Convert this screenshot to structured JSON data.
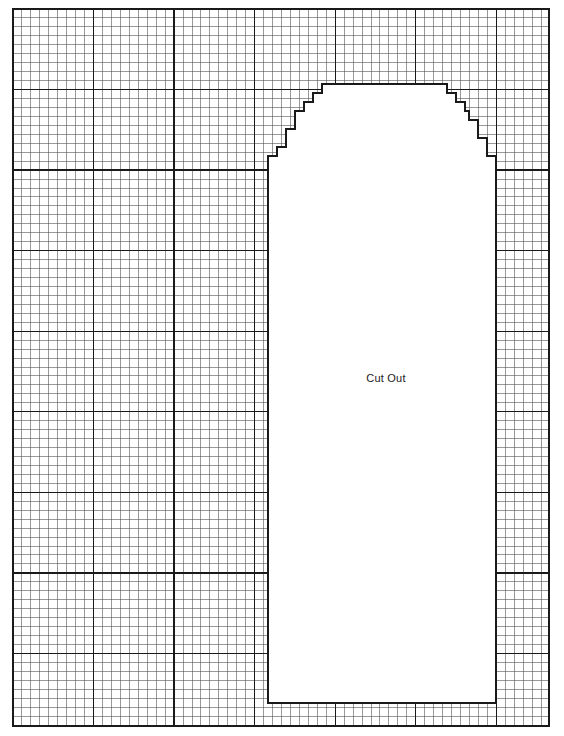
{
  "page": {
    "width": 564,
    "height": 736,
    "background_color": "#ffffff"
  },
  "grid": {
    "name": "graph-paper-grid",
    "origin_x": 13,
    "origin_y": 9,
    "right": 549,
    "bottom": 726,
    "minor_cell_px": 8.95,
    "major_every": 9,
    "minor_line_color": "#555555",
    "major_line_color": "#1a1a1a",
    "minor_line_width": 0.6,
    "major_line_width": 1.3,
    "border_color": "#1a1a1a",
    "border_width": 1.4
  },
  "cutout": {
    "name": "arch-cut-out-region",
    "label": "Cut Out",
    "label_x": 386,
    "label_y": 378,
    "fill_color": "#ffffff",
    "outline_color": "#1a1a1a",
    "outline_width": 1.6,
    "left_x": 268,
    "right_x": 496,
    "bottom_y": 703,
    "crown_top_y": 84,
    "crown_left_x": 331,
    "crown_right_x": 438,
    "shape_description": "stepped (staircase) gothic arch opening",
    "steps_left": [
      {
        "x": 268,
        "y": 165
      },
      {
        "x": 277,
        "y": 156
      },
      {
        "x": 286,
        "y": 147
      },
      {
        "x": 286,
        "y": 138
      },
      {
        "x": 295,
        "y": 129
      },
      {
        "x": 295,
        "y": 120
      },
      {
        "x": 304,
        "y": 111
      },
      {
        "x": 313,
        "y": 102
      },
      {
        "x": 322,
        "y": 93
      },
      {
        "x": 331,
        "y": 84
      }
    ],
    "steps_right": [
      {
        "x": 438,
        "y": 84
      },
      {
        "x": 447,
        "y": 93
      },
      {
        "x": 456,
        "y": 102
      },
      {
        "x": 465,
        "y": 111
      },
      {
        "x": 469,
        "y": 120
      },
      {
        "x": 478,
        "y": 129
      },
      {
        "x": 478,
        "y": 138
      },
      {
        "x": 487,
        "y": 147
      },
      {
        "x": 487,
        "y": 156
      },
      {
        "x": 496,
        "y": 165
      }
    ]
  }
}
